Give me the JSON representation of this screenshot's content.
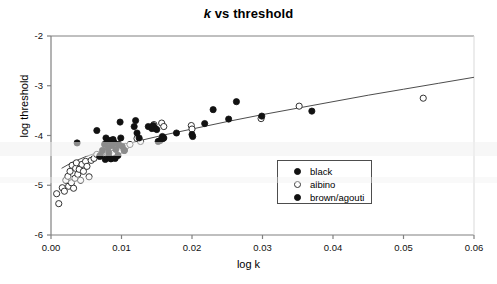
{
  "chart_data": {
    "type": "scatter",
    "title": "k vs threshold",
    "title_italic_prefix": "k",
    "title_rest": " vs threshold",
    "xlabel": "log k",
    "ylabel": "log threshold",
    "xlim": [
      0.0,
      0.06
    ],
    "ylim": [
      -6,
      -2
    ],
    "xticks": [
      0.0,
      0.01,
      0.02,
      0.03,
      0.04,
      0.05,
      0.06
    ],
    "xtick_labels": [
      "0.00",
      "0.01",
      "0.02",
      "0.03",
      "0.04",
      "0.05",
      "0.06"
    ],
    "yticks": [
      -2,
      -3,
      -4,
      -5,
      -6
    ],
    "ytick_labels": [
      "-2",
      "-3",
      "-4",
      "-5",
      "-6"
    ],
    "grid": false,
    "legend_position": "center-right",
    "legend": [
      {
        "label": "black",
        "marker": "filled-circle",
        "color": "#111111"
      },
      {
        "label": "albino",
        "marker": "open-circle",
        "color": "#ffffff"
      },
      {
        "label": "brown/agouti",
        "marker": "filled-circle",
        "color": "#111111"
      }
    ],
    "series": [
      {
        "name": "black",
        "marker": "filled-circle",
        "color": "#111111",
        "points": [
          [
            0.0037,
            -4.15
          ],
          [
            0.0065,
            -3.9
          ],
          [
            0.0069,
            -4.42
          ],
          [
            0.0073,
            -4.3
          ],
          [
            0.0076,
            -4.18
          ],
          [
            0.0078,
            -4.05
          ],
          [
            0.008,
            -4.12
          ],
          [
            0.0081,
            -4.25
          ],
          [
            0.0082,
            -4.35
          ],
          [
            0.0083,
            -4.45
          ],
          [
            0.0084,
            -4.1
          ],
          [
            0.0086,
            -4.2
          ],
          [
            0.0088,
            -4.08
          ],
          [
            0.009,
            -4.15
          ],
          [
            0.0092,
            -4.28
          ],
          [
            0.0095,
            -4.4
          ],
          [
            0.0096,
            -4.18
          ],
          [
            0.0098,
            -3.73
          ],
          [
            0.0099,
            -4.05
          ],
          [
            0.0101,
            -4.22
          ],
          [
            0.0104,
            -4.3
          ],
          [
            0.0118,
            -3.82
          ],
          [
            0.012,
            -3.7
          ],
          [
            0.0122,
            -3.95
          ],
          [
            0.0125,
            -4.05
          ],
          [
            0.0138,
            -3.82
          ],
          [
            0.0145,
            -3.8
          ],
          [
            0.0148,
            -3.86
          ],
          [
            0.0152,
            -4.12
          ],
          [
            0.0158,
            -4.02
          ],
          [
            0.016,
            -4.05
          ],
          [
            0.0178,
            -3.95
          ],
          [
            0.02,
            -3.98
          ],
          [
            0.0201,
            -4.02
          ],
          [
            0.0218,
            -3.76
          ],
          [
            0.023,
            -3.48
          ],
          [
            0.0252,
            -3.67
          ],
          [
            0.0263,
            -3.32
          ],
          [
            0.0299,
            -3.61
          ],
          [
            0.037,
            -3.51
          ]
        ]
      },
      {
        "name": "albino",
        "marker": "open-circle",
        "color": "#ffffff",
        "points": [
          [
            0.0008,
            -5.17
          ],
          [
            0.0011,
            -5.37
          ],
          [
            0.0016,
            -5.05
          ],
          [
            0.0019,
            -5.12
          ],
          [
            0.0021,
            -4.9
          ],
          [
            0.0024,
            -4.82
          ],
          [
            0.0025,
            -5.02
          ],
          [
            0.0027,
            -4.72
          ],
          [
            0.0029,
            -4.95
          ],
          [
            0.003,
            -4.6
          ],
          [
            0.0032,
            -5.06
          ],
          [
            0.0034,
            -4.86
          ],
          [
            0.0035,
            -4.66
          ],
          [
            0.0036,
            -4.55
          ],
          [
            0.0038,
            -4.78
          ],
          [
            0.004,
            -4.68
          ],
          [
            0.0042,
            -4.9
          ],
          [
            0.0044,
            -4.58
          ],
          [
            0.0046,
            -4.72
          ],
          [
            0.0049,
            -4.52
          ],
          [
            0.0051,
            -4.62
          ],
          [
            0.0054,
            -4.83
          ],
          [
            0.0057,
            -4.5
          ],
          [
            0.0061,
            -4.46
          ],
          [
            0.0065,
            -4.38
          ],
          [
            0.0072,
            -4.4
          ],
          [
            0.0079,
            -4.34
          ],
          [
            0.0088,
            -4.36
          ],
          [
            0.0098,
            -4.3
          ],
          [
            0.0106,
            -4.22
          ],
          [
            0.0112,
            -4.18
          ],
          [
            0.0122,
            -4.06
          ],
          [
            0.0127,
            -4.12
          ],
          [
            0.0146,
            -3.78
          ],
          [
            0.0157,
            -3.75
          ],
          [
            0.016,
            -3.82
          ],
          [
            0.0199,
            -3.8
          ],
          [
            0.02,
            -3.87
          ],
          [
            0.0298,
            -3.66
          ],
          [
            0.0352,
            -3.41
          ],
          [
            0.0528,
            -3.25
          ]
        ]
      },
      {
        "name": "brown/agouti",
        "marker": "filled-circle",
        "color": "#111111",
        "points": [
          [
            0.007,
            -4.4
          ],
          [
            0.0077,
            -4.48
          ],
          [
            0.0082,
            -4.44
          ],
          [
            0.0085,
            -4.47
          ],
          [
            0.0091,
            -4.46
          ],
          [
            0.0104,
            -4.3
          ],
          [
            0.0143,
            -3.86
          ],
          [
            0.015,
            -3.88
          ],
          [
            0.0155,
            -4.1
          ],
          [
            0.0159,
            -4.06
          ]
        ]
      }
    ],
    "fit_curve": {
      "name": "fitted trend line",
      "color": "#4d4d4d",
      "points": [
        [
          0.0015,
          -4.66
        ],
        [
          0.003,
          -4.54
        ],
        [
          0.005,
          -4.42
        ],
        [
          0.0075,
          -4.3
        ],
        [
          0.01,
          -4.2
        ],
        [
          0.013,
          -4.09
        ],
        [
          0.016,
          -3.99
        ],
        [
          0.02,
          -3.87
        ],
        [
          0.025,
          -3.72
        ],
        [
          0.03,
          -3.58
        ],
        [
          0.035,
          -3.45
        ],
        [
          0.04,
          -3.32
        ],
        [
          0.045,
          -3.19
        ],
        [
          0.05,
          -3.07
        ],
        [
          0.055,
          -2.95
        ],
        [
          0.06,
          -2.83
        ]
      ]
    }
  }
}
